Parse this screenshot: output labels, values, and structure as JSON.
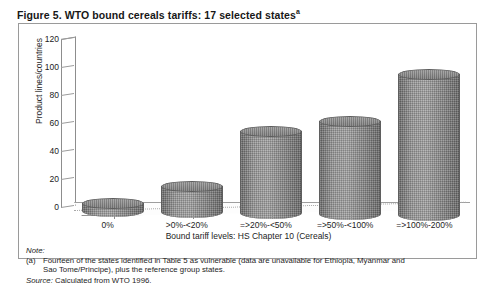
{
  "figure": {
    "caption": "Figure 5. WTO bound cereals tariffs: 17 selected states",
    "caption_superscript": "a"
  },
  "notes": {
    "note_heading": "Note:",
    "note_marker": "(a)",
    "note_line1": "Fourteen of the states identified in Table 5 as vulnerable (data are unavailable for Ethiopia, Myanmar and",
    "note_line2": "Sao Tome/Principe), plus the reference group states.",
    "source_heading": "Source:",
    "source_text": "Calculated from WTO 1996."
  },
  "chart_data": {
    "type": "bar",
    "title": "Figure 5. WTO bound cereals tariffs: 17 selected states",
    "xlabel": "Bound tariff levels: HS Chapter 10 (Cereals)",
    "ylabel": "Product lines/countries",
    "categories": [
      "0%",
      ">0%-<20%",
      "=>20%-<50%",
      "=>50%-<100%",
      "=>100%-200%"
    ],
    "values": [
      9,
      22,
      62,
      70,
      104
    ],
    "ylim": [
      0,
      120
    ],
    "yticks": [
      0,
      20,
      40,
      60,
      80,
      100,
      120
    ],
    "grid": true,
    "legend": "none",
    "style": "3d-cylinder",
    "bar_color": "#8b8b8b"
  }
}
